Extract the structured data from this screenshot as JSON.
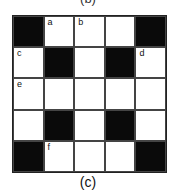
{
  "top_label": "(b)",
  "caption": "(c)",
  "grid": {
    "rows": 5,
    "cols": 5,
    "cells": [
      [
        {
          "black": true,
          "label": ""
        },
        {
          "black": false,
          "label": "a"
        },
        {
          "black": false,
          "label": "b"
        },
        {
          "black": false,
          "label": ""
        },
        {
          "black": true,
          "label": ""
        }
      ],
      [
        {
          "black": false,
          "label": "c"
        },
        {
          "black": true,
          "label": ""
        },
        {
          "black": false,
          "label": ""
        },
        {
          "black": true,
          "label": ""
        },
        {
          "black": false,
          "label": "d"
        }
      ],
      [
        {
          "black": false,
          "label": "e"
        },
        {
          "black": false,
          "label": ""
        },
        {
          "black": false,
          "label": ""
        },
        {
          "black": false,
          "label": ""
        },
        {
          "black": false,
          "label": ""
        }
      ],
      [
        {
          "black": false,
          "label": ""
        },
        {
          "black": true,
          "label": ""
        },
        {
          "black": false,
          "label": ""
        },
        {
          "black": true,
          "label": ""
        },
        {
          "black": false,
          "label": ""
        }
      ],
      [
        {
          "black": true,
          "label": ""
        },
        {
          "black": false,
          "label": "f"
        },
        {
          "black": false,
          "label": ""
        },
        {
          "black": false,
          "label": ""
        },
        {
          "black": true,
          "label": ""
        }
      ]
    ]
  },
  "colors": {
    "black_cell": "#0a0a0a",
    "white_cell": "#ffffff",
    "line": "#444444"
  }
}
